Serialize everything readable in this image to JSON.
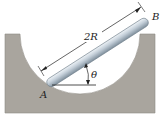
{
  "diagram": {
    "labels": {
      "point_a": "A",
      "point_b": "B",
      "length": "2R",
      "angle": "θ"
    },
    "colors": {
      "block": "#a8a49d",
      "cavity": "#ffffff",
      "rod_light": "#dfe7ee",
      "rod_dark": "#8a9aa8",
      "line": "#222222"
    }
  }
}
